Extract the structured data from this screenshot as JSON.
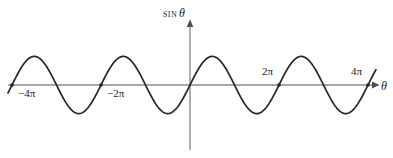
{
  "figure": {
    "background_color": "#ffffff",
    "curve_color": "#1a1a1a",
    "axis_color": "#8c8c8c",
    "text_color": "#1a1a1a"
  },
  "labels": {
    "y_axis_function": "sin",
    "y_axis_variable": "θ",
    "x_axis_variable": "θ",
    "tick_neg4pi": "−4π",
    "tick_neg2pi": "−2π",
    "tick_pos2pi": "2π",
    "tick_pos4pi": "4π"
  },
  "chart_data": {
    "type": "line",
    "title": "",
    "xlabel": "θ",
    "ylabel": "sin θ",
    "function": "y = sin(θ)",
    "xlim": [
      -4.6,
      4.6
    ],
    "ylim": [
      -1.35,
      1.35
    ],
    "x_unit": "π",
    "grid": false,
    "legend": false,
    "xticks": [
      -4,
      -2,
      2,
      4
    ],
    "xtick_labels": [
      "−4π",
      "−2π",
      "2π",
      "4π"
    ],
    "yticks": [],
    "ytick_labels": [],
    "amplitude": 1,
    "period": "2π",
    "series": [
      {
        "name": "sin θ",
        "x": [
          -4.6,
          -4.5,
          -4.25,
          -4.0,
          -3.75,
          -3.5,
          -3.25,
          -3.0,
          -2.75,
          -2.5,
          -2.25,
          -2.0,
          -1.75,
          -1.5,
          -1.25,
          -1.0,
          -0.75,
          -0.5,
          -0.25,
          0.0,
          0.25,
          0.5,
          0.75,
          1.0,
          1.25,
          1.5,
          1.75,
          2.0,
          2.25,
          2.5,
          2.75,
          3.0,
          3.25,
          3.5,
          3.75,
          4.0,
          4.25,
          4.5,
          4.6
        ],
        "y": [
          -0.951,
          -1.0,
          -0.707,
          0.0,
          0.707,
          1.0,
          0.707,
          0.0,
          -0.707,
          -1.0,
          -0.707,
          0.0,
          0.707,
          1.0,
          0.707,
          0.0,
          -0.707,
          -1.0,
          -0.707,
          0.0,
          0.707,
          1.0,
          0.707,
          0.0,
          -0.707,
          -1.0,
          -0.707,
          0.0,
          0.707,
          1.0,
          0.707,
          0.0,
          -0.707,
          -1.0,
          -0.707,
          0.0,
          0.707,
          1.0,
          0.951
        ]
      }
    ],
    "annotations": [
      {
        "text": "−4π",
        "x": -4,
        "y": 0,
        "position": "below-right"
      },
      {
        "text": "−2π",
        "x": -2,
        "y": 0,
        "position": "below-right"
      },
      {
        "text": "2π",
        "x": 2,
        "y": 0,
        "position": "above-left"
      },
      {
        "text": "4π",
        "x": 4,
        "y": 0,
        "position": "above-left"
      }
    ]
  }
}
